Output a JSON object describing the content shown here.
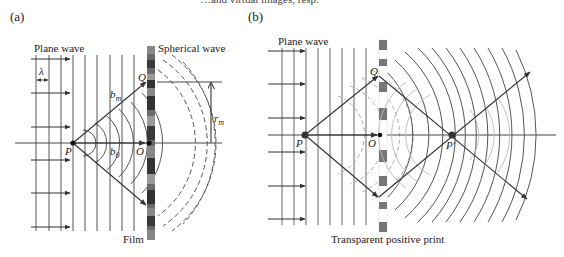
{
  "top_text_fragment": "…and virtual images, resp.",
  "panel_a": {
    "label": "(a)",
    "plane_wave_label": "Plane wave",
    "spherical_wave_label": "Spherical wave",
    "film_label": "Film",
    "lambda_label": "λ",
    "point_P": "P",
    "point_O": "O",
    "point_Q": "Q",
    "b_m_main": "b",
    "b_m_sub": "m",
    "b_0_main": "b",
    "b_0_sub": "0",
    "r_m_main": "r",
    "r_m_sub": "m"
  },
  "panel_b": {
    "label": "(b)",
    "plane_wave_label": "Plane wave",
    "print_label": "Transparent positive print",
    "point_P": "P",
    "point_O": "O",
    "point_Q": "Q",
    "point_P_prime": "P′"
  },
  "colors": {
    "line": "#333333",
    "grating_dark": "#555555",
    "grating_mid": "#888888",
    "faint_wave": "#aaaaaa"
  }
}
